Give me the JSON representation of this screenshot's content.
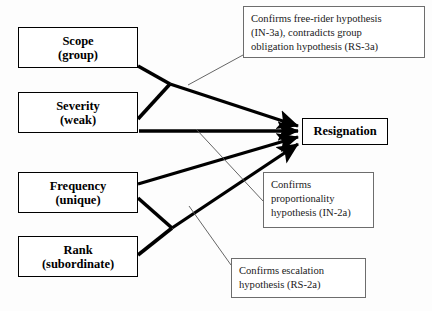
{
  "diagram": {
    "colors": {
      "line": "#000000",
      "note_border": "#6d6d6d",
      "background": "#fdfdfd",
      "text": "#000000"
    },
    "factors": [
      {
        "id": "scope",
        "line1": "Scope",
        "line2": "(group)"
      },
      {
        "id": "severity",
        "line1": "Severity",
        "line2": "(weak)"
      },
      {
        "id": "frequency",
        "line1": "Frequency",
        "line2": "(unique)"
      },
      {
        "id": "rank",
        "line1": "Rank",
        "line2": "(subordinate)"
      }
    ],
    "outcome": {
      "id": "resignation",
      "label": "Resignation"
    },
    "notes": [
      {
        "id": "free-rider",
        "lines": [
          "Confirms free-rider hypothesis",
          "(IN-3a), contradicts group",
          "obligation hypothesis (RS-3a)"
        ]
      },
      {
        "id": "proportionality",
        "lines": [
          "Confirms",
          "proportionality",
          "hypothesis (IN-2a)"
        ]
      },
      {
        "id": "escalation",
        "lines": [
          "Confirms escalation",
          "hypothesis (RS-2a)"
        ]
      }
    ]
  }
}
